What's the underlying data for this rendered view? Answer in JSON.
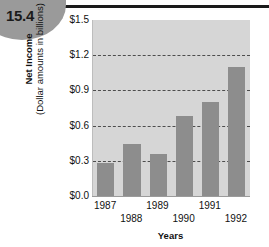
{
  "badge": {
    "number": "15.4"
  },
  "chart_data": {
    "type": "bar",
    "title": "",
    "xlabel": "Years",
    "ylabel_line1": "Net Income",
    "ylabel_line2": "(Dollar amounts in billions)",
    "categories": [
      "1987",
      "1988",
      "1989",
      "1990",
      "1991",
      "1992"
    ],
    "values": [
      0.28,
      0.44,
      0.36,
      0.68,
      0.8,
      1.1
    ],
    "ylim": [
      0.0,
      1.5
    ],
    "yticks": [
      0.0,
      0.3,
      0.6,
      0.9,
      1.2,
      1.5
    ],
    "ytick_labels": [
      "$0.0",
      "$0.3",
      "$0.6",
      "$0.9",
      "$1.2",
      "$1.5"
    ],
    "grid": true,
    "gridlines_at": [
      0.3,
      0.6,
      0.9,
      1.2
    ],
    "legend": null,
    "bar_color": "#8d8d8d",
    "plot_background": "#d6d6d6",
    "gridline_color": "#4d4d4d"
  }
}
